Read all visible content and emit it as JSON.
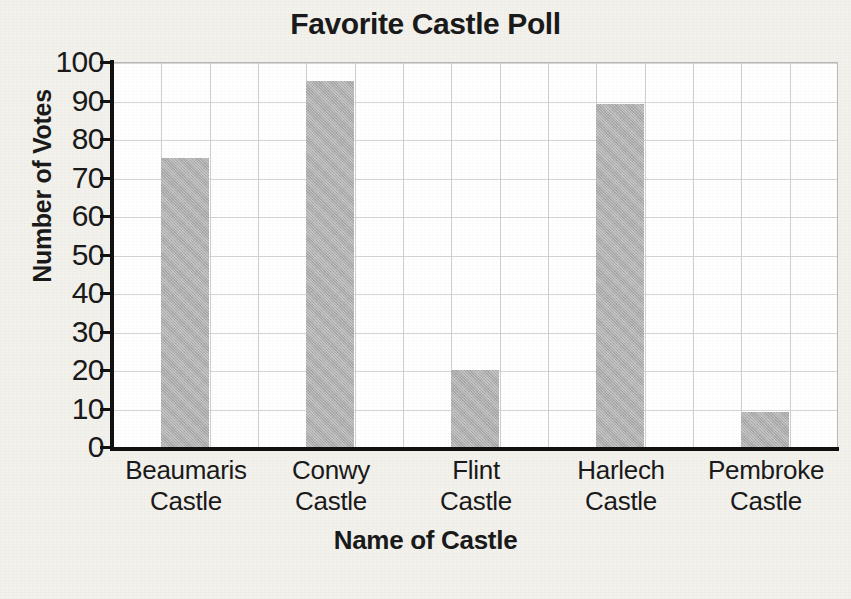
{
  "chart_data": {
    "type": "bar",
    "title": "Favorite Castle Poll",
    "xlabel": "Name of Castle",
    "ylabel": "Number of Votes",
    "categories": [
      "Beaumaris Castle",
      "Conwy Castle",
      "Flint Castle",
      "Harlech Castle",
      "Pembroke Castle"
    ],
    "category_lines": [
      [
        "Beaumaris",
        "Castle"
      ],
      [
        "Conwy",
        "Castle"
      ],
      [
        "Flint",
        "Castle"
      ],
      [
        "Harlech",
        "Castle"
      ],
      [
        "Pembroke",
        "Castle"
      ]
    ],
    "values": [
      75,
      95,
      20,
      89,
      9
    ],
    "ylim": [
      0,
      100
    ],
    "ytick_values": [
      100,
      90,
      80,
      70,
      60,
      50,
      40,
      30,
      20,
      10,
      0
    ],
    "ytick_labels": [
      "100",
      "90",
      "80",
      "70",
      "60",
      "50",
      "40",
      "30",
      "20",
      "10",
      "0"
    ],
    "ystep": 10,
    "grid": "both",
    "legend": "none",
    "bar_color": "#aeaeae",
    "plot_background": "#ffffff",
    "page_background": "#f2f1ec",
    "axis_color": "#111111",
    "gridline_color": "#d5d5d5",
    "vertical_gridline_count": 15,
    "bar_grid_columns": [
      2,
      5,
      8,
      11,
      14
    ]
  },
  "chart": {
    "title": "Favorite Castle Poll",
    "y_axis_title": "Number of Votes",
    "x_axis_title": "Name of Castle"
  }
}
